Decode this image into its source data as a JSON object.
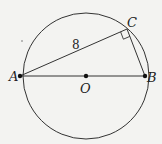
{
  "diagram": {
    "type": "geometry",
    "colors": {
      "background": "#f3f3f1",
      "stroke": "#333333",
      "points": "#111111"
    },
    "circle": {
      "center_label": "O",
      "cx": 86,
      "cy": 76,
      "r": 63
    },
    "points": [
      {
        "label": "A",
        "x": 20,
        "y": 76
      },
      {
        "label": "B",
        "x": 145,
        "y": 76
      },
      {
        "label": "C",
        "x": 127,
        "y": 29
      },
      {
        "label": "O",
        "x": 86,
        "y": 76
      }
    ],
    "segments": [
      {
        "from": "A",
        "to": "B"
      },
      {
        "from": "A",
        "to": "C"
      },
      {
        "from": "C",
        "to": "B"
      }
    ],
    "right_angle_at": "C",
    "length_labels": [
      {
        "segment": "AC",
        "text": "8"
      }
    ]
  },
  "labels": {
    "a": "A",
    "b": "B",
    "c": "C",
    "o": "O",
    "ac_length": "8"
  }
}
